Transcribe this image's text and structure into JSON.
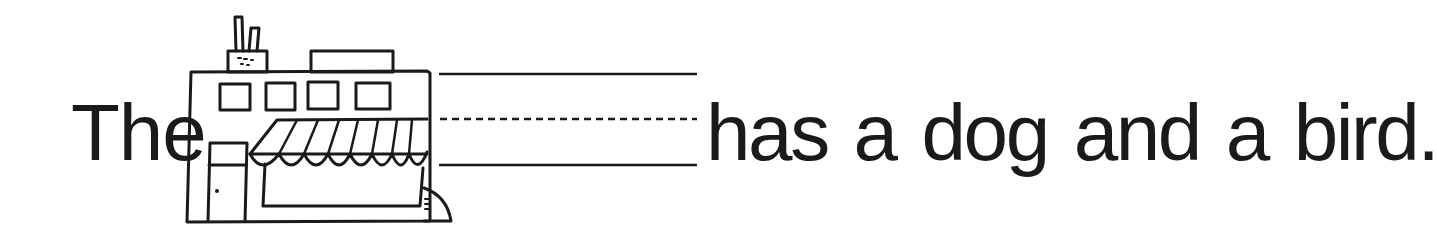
{
  "worksheet": {
    "sentence": {
      "before_blank": "The",
      "after_blank": "has a dog and a bird.",
      "blank_answer": ""
    },
    "picture": {
      "subject": "pet shop building",
      "icon": "store-building-icon",
      "details": [
        "two chimney pipes",
        "four upper windows",
        "striped scalloped awning",
        "door with knob",
        "storefront window"
      ]
    },
    "writing_lines": {
      "top": "solid",
      "middle": "dashed",
      "bottom": "solid"
    },
    "colors": {
      "ink": "#1a1a1a",
      "paper": "#ffffff"
    }
  }
}
